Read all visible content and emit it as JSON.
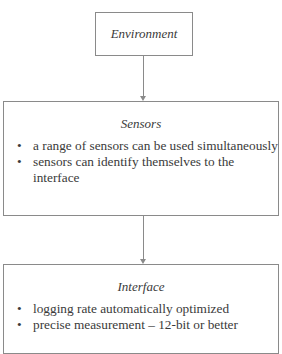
{
  "diagram": {
    "nodes": [
      {
        "id": "environment",
        "title": "Environment",
        "bullets": []
      },
      {
        "id": "sensors",
        "title": "Sensors",
        "bullets": [
          "a range of sensors can be used simultaneously",
          "sensors can identify themselves to the interface"
        ]
      },
      {
        "id": "interface",
        "title": "Interface",
        "bullets": [
          "logging rate automatically optimized",
          "precise measurement – 12-bit or better"
        ]
      }
    ],
    "edges": [
      {
        "from": "environment",
        "to": "sensors"
      },
      {
        "from": "sensors",
        "to": "interface"
      }
    ]
  }
}
